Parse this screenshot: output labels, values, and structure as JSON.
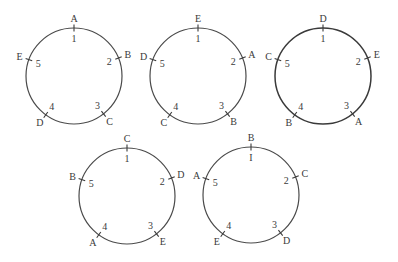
{
  "diagram": {
    "tick_angles_deg": [
      -90,
      -22,
      52,
      126,
      200
    ],
    "label_radius_offset": 10,
    "number_radius_offset": -10,
    "circles": [
      {
        "id": "circle-1",
        "cx": 74,
        "cy": 76,
        "r": 48,
        "bold": false,
        "numbers": [
          "1",
          "2",
          "3",
          "4",
          "5"
        ],
        "letters": [
          "A",
          "B",
          "C",
          "D",
          "E"
        ]
      },
      {
        "id": "circle-2",
        "cx": 198,
        "cy": 76,
        "r": 48,
        "bold": false,
        "numbers": [
          "1",
          "2",
          "3",
          "4",
          "5"
        ],
        "letters": [
          "E",
          "A",
          "B",
          "C",
          "D"
        ]
      },
      {
        "id": "circle-3",
        "cx": 323,
        "cy": 76,
        "r": 48,
        "bold": true,
        "numbers": [
          "1",
          "2",
          "3",
          "4",
          "5"
        ],
        "letters": [
          "D",
          "E",
          "A",
          "B",
          "C"
        ]
      },
      {
        "id": "circle-4",
        "cx": 127,
        "cy": 196,
        "r": 48,
        "bold": false,
        "numbers": [
          "1",
          "2",
          "3",
          "4",
          "5"
        ],
        "letters": [
          "C",
          "D",
          "E",
          "A",
          "B"
        ]
      },
      {
        "id": "circle-5",
        "cx": 251,
        "cy": 195,
        "r": 48,
        "bold": false,
        "numbers": [
          "I",
          "2",
          "3",
          "4",
          "5"
        ],
        "letters": [
          "B",
          "C",
          "D",
          "E",
          "A"
        ]
      }
    ]
  }
}
